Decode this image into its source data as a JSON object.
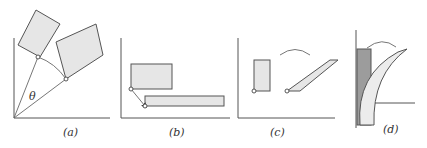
{
  "figure": {
    "panels": [
      {
        "id": "a",
        "label": "(a)",
        "angle_label": "θ",
        "description": "Rectangle rotated about the origin by angle θ"
      },
      {
        "id": "b",
        "label": "(b)",
        "description": "Rectangle translated/scaled along the baseline"
      },
      {
        "id": "c",
        "label": "(c)",
        "description": "Rectangle sheared into a parallelogram"
      },
      {
        "id": "d",
        "label": "(d)",
        "description": "Rectangle bent into a curved shape"
      }
    ]
  }
}
